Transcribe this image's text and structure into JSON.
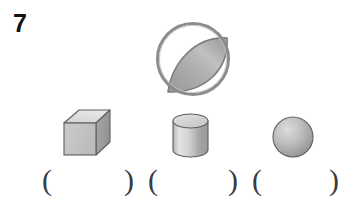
{
  "worksheet": {
    "problem_number": "7",
    "background_color": "#ffffff"
  },
  "figures": {
    "composite": {
      "name": "circle-with-shaded-lens",
      "outline_color": "#8a8a8a",
      "fill_color": "#a9a9a9",
      "circle": {
        "cx": 193,
        "cy": 59,
        "r": 36
      },
      "lens_label": "shaded-lens-region"
    },
    "solids": [
      {
        "name": "cube",
        "label": "cube",
        "outline_color": "#5a5a5a",
        "top_face_color": "#dcdcdc",
        "front_face_color": "#c6c6c6",
        "side_face_color": "#9d9d9d"
      },
      {
        "name": "cylinder",
        "label": "cylinder",
        "outline_color": "#5a5a5a",
        "top_face_color": "#d8d8d8",
        "body_light_color": "#e2e2e2",
        "body_dark_color": "#9a9a9a"
      },
      {
        "name": "sphere",
        "label": "sphere",
        "outline_color": "#5a5a5a",
        "highlight_color": "#d6d6d6",
        "shadow_color": "#8f8f8f"
      }
    ]
  },
  "answers": {
    "open_paren": "(",
    "close_paren": ")",
    "blanks": [
      {
        "id": "answer-blank-1",
        "value": "",
        "open_x": 42,
        "close_x": 124
      },
      {
        "id": "answer-blank-2",
        "value": "",
        "open_x": 148,
        "close_x": 228
      },
      {
        "id": "answer-blank-3",
        "value": "",
        "open_x": 252,
        "close_x": 329
      }
    ]
  }
}
